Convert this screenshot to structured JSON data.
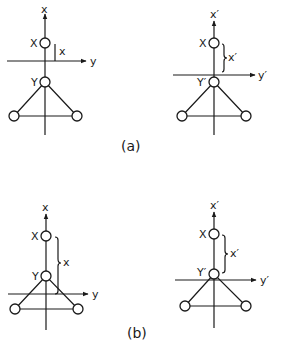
{
  "figure": {
    "panel_a": {
      "caption": "(a)",
      "left": {
        "axis_vertical_label": "x",
        "axis_horizontal_label": "y",
        "atom_top_label": "X",
        "atom_center_label": "Y",
        "distance_label": "x"
      },
      "right": {
        "axis_vertical_label": "x′",
        "axis_horizontal_label": "y′",
        "atom_top_label": "X",
        "atom_center_label": "Y′",
        "distance_label": "x′"
      }
    },
    "panel_b": {
      "caption": "(b)",
      "left": {
        "axis_vertical_label": "x",
        "axis_horizontal_label": "y",
        "atom_top_label": "X",
        "atom_center_label": "Y",
        "distance_label": "x"
      },
      "right": {
        "axis_vertical_label": "x′",
        "axis_horizontal_label": "y′",
        "atom_top_label": "X",
        "atom_center_label": "Y′",
        "distance_label": "x′"
      }
    }
  },
  "colors": {
    "ink": "#1a1a1a",
    "background": "#ffffff"
  }
}
